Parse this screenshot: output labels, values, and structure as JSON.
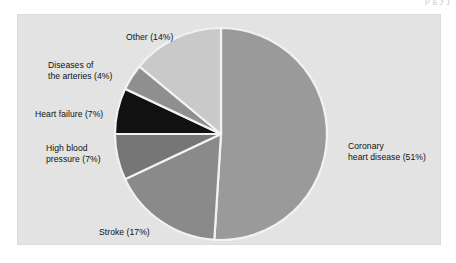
{
  "page": {
    "background_color": "#ffffff",
    "top_cropped_textline": "p g y j"
  },
  "figure": {
    "panel_background_color": "#e3e3e3",
    "panel_border_color": "#dcdcdc",
    "separator_color": "#f2f2f2"
  },
  "chart_data": {
    "type": "pie",
    "title": "",
    "subtitle": "",
    "xlabel": "",
    "ylabel": "",
    "legend_position": "none",
    "grid": false,
    "units": "percent",
    "total": 100,
    "start_angle_deg": 0,
    "direction": "clockwise",
    "categories": [
      "Coronary heart disease",
      "Stroke",
      "High blood pressure",
      "Heart failure",
      "Diseases of the arteries",
      "Other"
    ],
    "values": [
      51,
      17,
      7,
      7,
      4,
      14
    ],
    "colors": [
      "#9a9a9a",
      "#8a8a8a",
      "#767676",
      "#111111",
      "#8f8f8f",
      "#c9c9c9"
    ],
    "labels": [
      "Coronary\nheart disease (51%)",
      "Stroke (17%)",
      "High blood\npressure (7%)",
      "Heart failure (7%)",
      "Diseases of\nthe arteries (4%)",
      "Other (14%)"
    ],
    "slices": [
      {
        "name": "Coronary heart disease",
        "value": 51,
        "label": "Coronary\nheart disease (51%)",
        "color": "#9a9a9a"
      },
      {
        "name": "Stroke",
        "value": 17,
        "label": "Stroke (17%)",
        "color": "#8a8a8a"
      },
      {
        "name": "High blood pressure",
        "value": 7,
        "label": "High blood\npressure (7%)",
        "color": "#767676"
      },
      {
        "name": "Heart failure",
        "value": 7,
        "label": "Heart failure (7%)",
        "color": "#111111"
      },
      {
        "name": "Diseases of the arteries",
        "value": 4,
        "label": "Diseases of\nthe arteries (4%)",
        "color": "#8f8f8f"
      },
      {
        "name": "Other",
        "value": 14,
        "label": "Other (14%)",
        "color": "#c9c9c9"
      }
    ]
  }
}
